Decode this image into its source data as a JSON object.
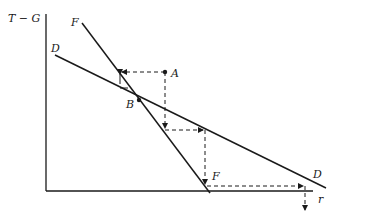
{
  "diagram": {
    "y_axis_label": "T − G",
    "x_axis_label": "r",
    "curves": [
      {
        "name": "F",
        "label_top": "F",
        "label_bottom": "F"
      },
      {
        "name": "D",
        "label_top": "D",
        "label_bottom": "D"
      }
    ],
    "points": [
      {
        "name": "A",
        "label": "A"
      },
      {
        "name": "B",
        "label": "B"
      }
    ],
    "colors": {
      "ink": "#1a1a1a",
      "background": "#ffffff"
    }
  }
}
